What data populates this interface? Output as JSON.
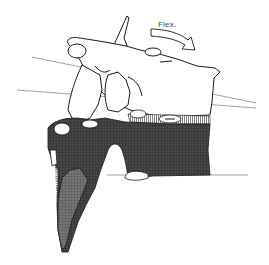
{
  "figure": {
    "annotation": "Flex.",
    "motion": "flexion",
    "colors": {
      "background": "#ffffff",
      "outline": "#1a1a1a",
      "dark_fill": "#3a3a3a",
      "stipple_fill": "#555555",
      "reference_line": "#777777"
    }
  }
}
